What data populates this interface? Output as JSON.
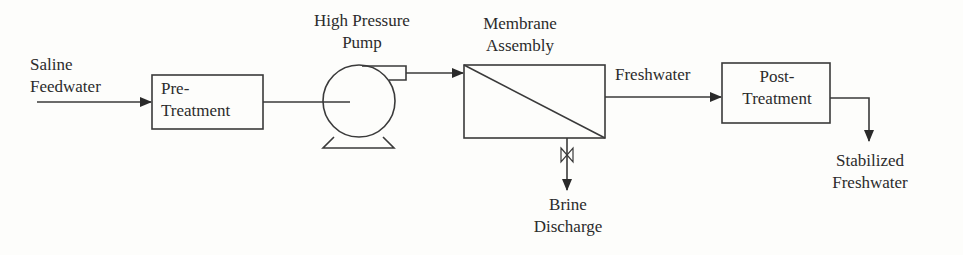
{
  "diagram": {
    "colors": {
      "line": "#3a3a3a",
      "text": "#2b2b2b",
      "background": "#fdfdfb"
    },
    "labels": {
      "saline_line1": "Saline",
      "saline_line2": "Feedwater",
      "pretreat_line1": "Pre-",
      "pretreat_line2": "Treatment",
      "pump_line1": "High Pressure",
      "pump_line2": "Pump",
      "membrane_line1": "Membrane",
      "membrane_line2": "Assembly",
      "freshwater": "Freshwater",
      "posttreat_line1": "Post-",
      "posttreat_line2": "Treatment",
      "stabilized_line1": "Stabilized",
      "stabilized_line2": "Freshwater",
      "brine_line1": "Brine",
      "brine_line2": "Discharge"
    },
    "nodes": [
      {
        "id": "pre-treatment",
        "type": "box"
      },
      {
        "id": "high-pressure-pump",
        "type": "pump"
      },
      {
        "id": "membrane-assembly",
        "type": "membrane"
      },
      {
        "id": "post-treatment",
        "type": "box"
      }
    ],
    "edges": [
      {
        "from": "saline-feedwater",
        "to": "pre-treatment"
      },
      {
        "from": "pre-treatment",
        "to": "high-pressure-pump"
      },
      {
        "from": "high-pressure-pump",
        "to": "membrane-assembly"
      },
      {
        "from": "membrane-assembly",
        "to": "post-treatment",
        "label": "Freshwater"
      },
      {
        "from": "membrane-assembly",
        "to": "brine-discharge",
        "via": "valve"
      },
      {
        "from": "post-treatment",
        "to": "stabilized-freshwater"
      }
    ]
  }
}
